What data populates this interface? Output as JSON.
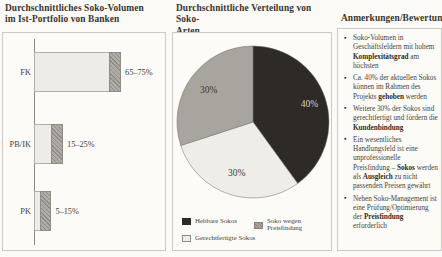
{
  "palette": {
    "background": "#fbfaf6",
    "border": "#ccc9c1",
    "text": "#413d36",
    "dark": "#2e2b27",
    "medium": "#a8a59e",
    "light": "#efede8",
    "axis": "#8d8a84"
  },
  "panels": {
    "bar": {
      "title_line1": "Durchschnittliches Soko-Volumen",
      "title_line2": "im Ist-Portfolio von Banken"
    },
    "pie": {
      "title_line1": "Durchschnittliche Verteilung von Soko-",
      "title_line2": "Arten"
    },
    "notes": {
      "title": "Anmerkungen/Bewertung"
    }
  },
  "chart_data": [
    {
      "type": "bar",
      "title": "Durchschnittliches Soko-Volumen im Ist-Portfolio von Banken",
      "orientation": "horizontal",
      "categories": [
        "FK",
        "PB/IK",
        "PK"
      ],
      "ranges": [
        [
          65,
          75
        ],
        [
          15,
          25
        ],
        [
          5,
          15
        ]
      ],
      "value_labels": [
        "65–75%",
        "15–25%",
        "5–15%"
      ],
      "unit": "%",
      "xlim": [
        0,
        100
      ],
      "grid": false,
      "note": "light segment = lower bound, hatched segment = range to upper bound"
    },
    {
      "type": "pie",
      "title": "Durchschnittliche Verteilung von Soko-Arten",
      "slices": [
        {
          "label": "Hebbare Sokos",
          "value": 40,
          "color": "#2e2b27",
          "text_color": "#d3d0ca",
          "label_text": "40%",
          "lr": 0.78
        },
        {
          "label": "Gerechtfertigte Sokos",
          "value": 30,
          "color": "#efede8",
          "text_color": "#3f3b34",
          "label_text": "30%",
          "lr": 0.7
        },
        {
          "label": "Soko wegen Preisfindung",
          "value": 30,
          "color": "#a8a59e",
          "text_color": "#3f3b34",
          "label_text": "30%",
          "lr": 0.72
        }
      ],
      "start_angle_deg": 0,
      "clockwise": true,
      "legend_position": "bottom"
    }
  ],
  "legend": [
    {
      "label": "Hebbare Sokos",
      "style": "dark"
    },
    {
      "label": "Soko wegen Preisfindung",
      "style": "hatch"
    },
    {
      "label": "Gerechtfertigte Sokos",
      "style": "light"
    }
  ],
  "notes": {
    "title": "Anmerkungen/Bewertung",
    "bullets": [
      [
        {
          "t": "Soko-Volumen in Geschäftsfeldern mit hohem "
        },
        {
          "t": "Komplexitätsgrad",
          "b": 1
        },
        {
          "t": " am höchsten"
        }
      ],
      [
        {
          "t": "Ca. 40% der aktuellen Sokos können im Rahmen des Projekts "
        },
        {
          "t": "gehoben",
          "b": 1
        },
        {
          "t": " werden"
        }
      ],
      [
        {
          "t": "Weitere 30% der Sokos sind gerechtfertigt und fördern die "
        },
        {
          "t": "Kundenbindung",
          "b": 1
        }
      ],
      [
        {
          "t": "Ein wesentliches Handlungsfeld ist eine unprofessionelle Preisfindung – "
        },
        {
          "t": "Sokos",
          "b": 1
        },
        {
          "t": " werden als "
        },
        {
          "t": "Ausgleich",
          "b": 1
        },
        {
          "t": " zu nicht passenden Preisen gewährt"
        }
      ],
      [
        {
          "t": "Neben Soko-Management ist eine Prüfung/Optimierung der "
        },
        {
          "t": "Preisfindung",
          "b": 1
        },
        {
          "t": " erforderlich"
        }
      ]
    ]
  },
  "layout_hints": {
    "bar_px_per_percent": 1.16
  }
}
